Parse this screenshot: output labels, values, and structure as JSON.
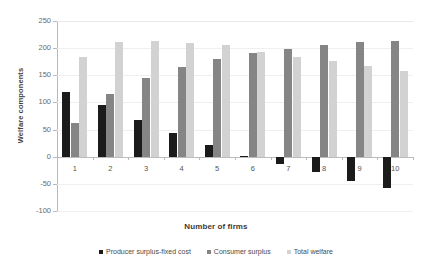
{
  "chart_data": {
    "type": "bar",
    "title": "",
    "subtitle": "",
    "xlabel": "Number of firms",
    "ylabel": "Welfare components",
    "categories": [
      "1",
      "2",
      "3",
      "4",
      "5",
      "6",
      "7",
      "8",
      "9",
      "10"
    ],
    "series": [
      {
        "name": "Producer surplus-fixed cost",
        "color": "#1b1b1b",
        "values": [
          120,
          96,
          67,
          43,
          22,
          2,
          -13,
          -28,
          -44,
          -58
        ]
      },
      {
        "name": "Consumer surplus",
        "color": "#858585",
        "values": [
          63,
          115,
          145,
          166,
          180,
          191,
          199,
          205,
          211,
          214
        ]
      },
      {
        "name": "Total welfare",
        "color": "#d2d2d2",
        "values": [
          184,
          211,
          214,
          210,
          205,
          193,
          184,
          176,
          167,
          157
        ]
      }
    ],
    "ylim": [
      -100,
      250
    ],
    "ytick_values": [
      250,
      200,
      150,
      100,
      50,
      0,
      -50,
      -100
    ],
    "ytick_labels": [
      "250",
      "200",
      "150",
      "100",
      "50",
      "0",
      "-50",
      "-100"
    ],
    "grid": true,
    "legend_position": "bottom"
  }
}
